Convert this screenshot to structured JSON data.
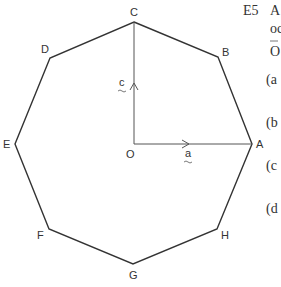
{
  "exercise": {
    "number": "E5",
    "text_lines": [
      "A",
      "oc",
      "O"
    ],
    "parts": [
      "(a",
      "(b",
      "(c",
      "(d"
    ]
  },
  "diagram": {
    "shape": "regular octagon",
    "center_label": "O",
    "vertices": [
      {
        "label": "A",
        "x": 252,
        "y": 144
      },
      {
        "label": "B",
        "x": 218,
        "y": 57
      },
      {
        "label": "C",
        "x": 134,
        "y": 22
      },
      {
        "label": "D",
        "x": 50,
        "y": 58
      },
      {
        "label": "E",
        "x": 15,
        "y": 144
      },
      {
        "label": "F",
        "x": 49,
        "y": 229
      },
      {
        "label": "G",
        "x": 133,
        "y": 264
      },
      {
        "label": "H",
        "x": 217,
        "y": 229
      }
    ],
    "vectors": [
      {
        "label": "a",
        "from": "O",
        "to": "A"
      },
      {
        "label": "c",
        "from": "O",
        "to": "C"
      }
    ],
    "line_color": "#333333"
  }
}
